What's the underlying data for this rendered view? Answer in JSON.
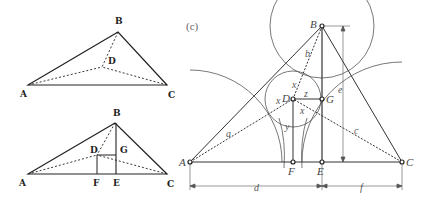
{
  "figure": {
    "panel_label": "(c)",
    "top_left": {
      "points": {
        "A": "A",
        "B": "B",
        "C": "C",
        "D": "D"
      }
    },
    "bottom_left": {
      "points": {
        "A": "A",
        "B": "B",
        "C": "C",
        "D": "D",
        "E": "E",
        "F": "F",
        "G": "G"
      }
    },
    "right": {
      "points": {
        "A": "A",
        "B": "B",
        "C": "C",
        "D": "D",
        "E": "E",
        "F": "F",
        "G": "G"
      },
      "segments": {
        "a": "a",
        "b": "b",
        "c": "c",
        "d": "d",
        "e": "e",
        "f": "f"
      },
      "variables": {
        "x1": "x",
        "x2": "x",
        "x3": "x",
        "y": "y",
        "z": "z"
      }
    }
  }
}
